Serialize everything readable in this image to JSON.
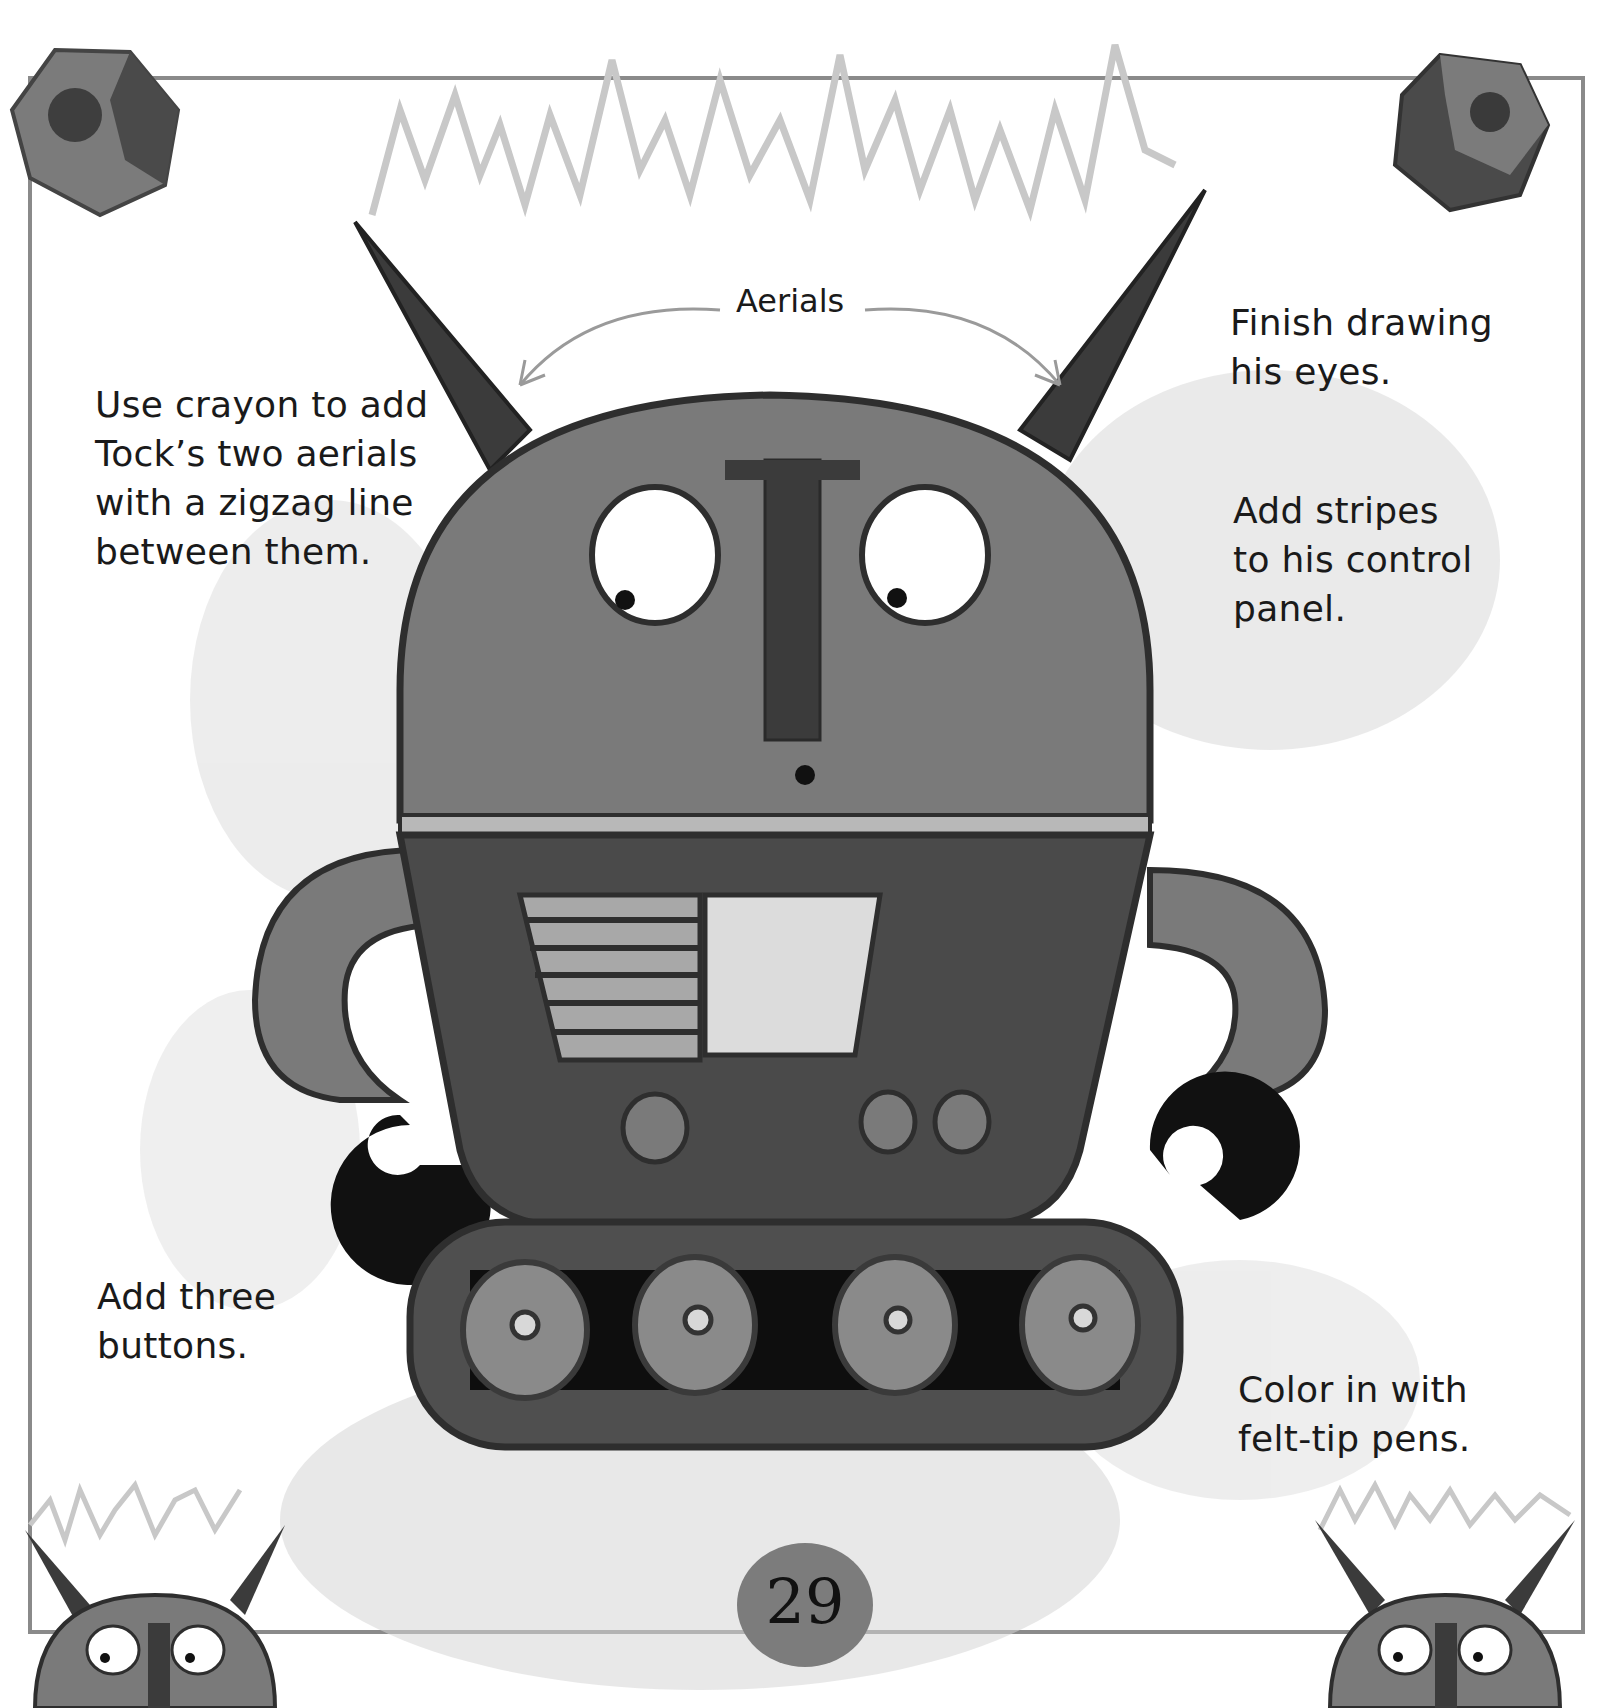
{
  "page": {
    "number": "29"
  },
  "labels": {
    "aerials": "Aerials"
  },
  "instructions": [
    {
      "id": "aerials",
      "text": "Use crayon to add\nTock’s two aerials\nwith a zigzag line\nbetween them."
    },
    {
      "id": "eyes",
      "text": "Finish drawing\nhis eyes."
    },
    {
      "id": "stripes",
      "text": "Add stripes\nto his control\npanel."
    },
    {
      "id": "buttons",
      "text": "Add three\nbuttons."
    },
    {
      "id": "color",
      "text": "Color in with\nfelt-tip pens."
    }
  ],
  "colors": {
    "frame": "#8a8a8a",
    "zigzag": "#c8c8c8",
    "body": "#7a7a7a",
    "body_dark": "#4a4a4a",
    "outline": "#2e2e2e",
    "panel_light": "#c4c4c4",
    "screen": "#e0e0e0",
    "hand": "#111111",
    "shading": "#d6d6d6"
  }
}
